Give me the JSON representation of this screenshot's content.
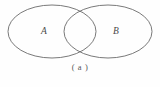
{
  "figure": {
    "type": "venn-diagram",
    "caption": "( a )",
    "background_color": "#fefefe",
    "stroke_color": "#6a6a6a",
    "label_color": "#4a4a4a",
    "caption_color": "#555555",
    "sets": [
      {
        "id": "set-a",
        "label": "A",
        "cx": 52,
        "cy": 31.5,
        "rx": 44,
        "ry": 26.5,
        "label_x": 44,
        "label_y": 32
      },
      {
        "id": "set-b",
        "label": "B",
        "cx": 108,
        "cy": 31.5,
        "rx": 44,
        "ry": 26.5,
        "label_x": 116,
        "label_y": 32
      }
    ],
    "intersection": {
      "upper_crossing_x": 80,
      "upper_crossing_y": 11,
      "lower_crossing_x": 80,
      "lower_crossing_y": 52
    }
  }
}
